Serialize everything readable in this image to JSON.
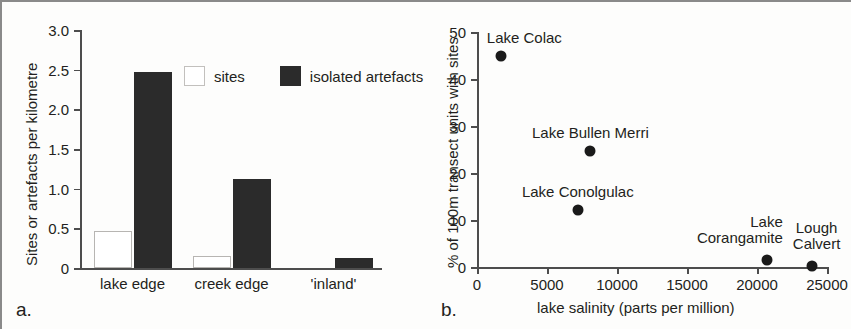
{
  "figure": {
    "panel_a_letter": "a.",
    "panel_b_letter": "b."
  },
  "chart_data": [
    {
      "type": "bar",
      "panel": "a",
      "title": "",
      "xlabel": "",
      "ylabel": "Sites or artefacts  per kilometre",
      "categories": [
        "lake edge",
        "creek edge",
        "'inland'"
      ],
      "ylim": [
        0,
        3.0
      ],
      "yticks": [
        "0",
        "0.5",
        "1.0",
        "1.5",
        "2.0",
        "2.5",
        "3.0"
      ],
      "ytick_values": [
        0,
        0.5,
        1.0,
        1.5,
        2.0,
        2.5,
        3.0
      ],
      "grid": false,
      "legend_position": "inside-top-center",
      "series": [
        {
          "name": "sites",
          "values": [
            0.47,
            0.15,
            0.0
          ],
          "color": "#ffffff",
          "style": "open"
        },
        {
          "name": "isolated artefacts",
          "values": [
            2.47,
            1.12,
            0.13
          ],
          "color": "#2b2b2b",
          "style": "filled"
        }
      ]
    },
    {
      "type": "scatter",
      "panel": "b",
      "title": "",
      "xlabel": "lake salinity (parts per million)",
      "ylabel": "% of 100m transect units with sites",
      "xlim": [
        0,
        25000
      ],
      "ylim": [
        0,
        50
      ],
      "xticks": [
        "0",
        "5000",
        "10000",
        "15000",
        "20000",
        "25000"
      ],
      "xtick_values": [
        0,
        5000,
        10000,
        15000,
        20000,
        25000
      ],
      "yticks": [
        "0",
        "10",
        "20",
        "30",
        "40",
        "50"
      ],
      "ytick_values": [
        0,
        10,
        20,
        30,
        40,
        50
      ],
      "grid": false,
      "legend_position": "none",
      "points": [
        {
          "label": "Lake Colac",
          "x": 1700,
          "y": 44.8,
          "label_align": "left",
          "label_dx": -14,
          "label_dy": -26
        },
        {
          "label": "Lake Bullen Merri",
          "x": 8100,
          "y": 24.7,
          "label_align": "center",
          "label_dx": 0,
          "label_dy": -26
        },
        {
          "label": "Lake Conolgulac",
          "x": 7200,
          "y": 12.1,
          "label_align": "center",
          "label_dx": 0,
          "label_dy": -26
        },
        {
          "label": "Lake\nCorangamite",
          "x": 20700,
          "y": 1.4,
          "label_align": "right",
          "label_dx": 16,
          "label_dy": -46
        },
        {
          "label": "Lough\nCalvert",
          "x": 23900,
          "y": 0.2,
          "label_align": "center",
          "label_dx": 5,
          "label_dy": -46
        }
      ]
    }
  ]
}
